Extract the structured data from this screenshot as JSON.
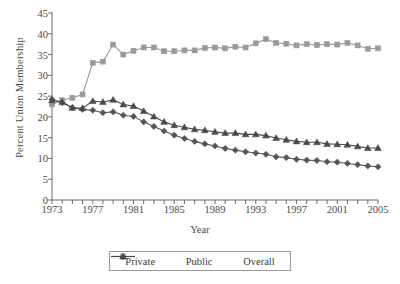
{
  "chart_data": {
    "type": "line",
    "title": "",
    "xlabel": "Year",
    "ylabel": "Percent Union Membership",
    "xlim": [
      1973,
      2005
    ],
    "ylim": [
      0,
      45
    ],
    "ytick_labels": [
      "0",
      "5",
      "10",
      "15",
      "20",
      "25",
      "30",
      "35",
      "40",
      "45"
    ],
    "ytick_values": [
      0,
      5,
      10,
      15,
      20,
      25,
      30,
      35,
      40,
      45
    ],
    "xtick_labels": [
      "1973",
      "1977",
      "1981",
      "1985",
      "1989",
      "1993",
      "1997",
      "2001",
      "2005"
    ],
    "xtick_values": [
      1973,
      1977,
      1981,
      1985,
      1989,
      1993,
      1997,
      2001,
      2005
    ],
    "xtick_minor_every": 1,
    "grid": false,
    "legend_position": "bottom-center",
    "x": [
      1973,
      1974,
      1975,
      1976,
      1977,
      1978,
      1979,
      1980,
      1981,
      1982,
      1983,
      1984,
      1985,
      1986,
      1987,
      1988,
      1989,
      1990,
      1991,
      1992,
      1993,
      1994,
      1995,
      1996,
      1997,
      1998,
      1999,
      2000,
      2001,
      2002,
      2003,
      2004,
      2005
    ],
    "series": [
      {
        "name": "Private",
        "marker": "diamond",
        "color": "#555555",
        "values": [
          24.2,
          23.4,
          22.2,
          21.8,
          21.6,
          21.0,
          21.2,
          20.4,
          20.1,
          18.8,
          17.7,
          16.6,
          15.6,
          14.8,
          14.1,
          13.5,
          13.0,
          12.4,
          12.0,
          11.6,
          11.3,
          11.0,
          10.4,
          10.2,
          9.8,
          9.6,
          9.5,
          9.2,
          9.1,
          8.8,
          8.5,
          8.2,
          8.0
        ],
        "final_value": 8.0
      },
      {
        "name": "Public",
        "marker": "square",
        "color": "#9a9a9a",
        "values": [
          23.0,
          24.0,
          24.6,
          25.4,
          33.0,
          33.3,
          37.4,
          35.0,
          35.9,
          36.7,
          36.7,
          35.8,
          35.8,
          36.0,
          36.0,
          36.6,
          36.7,
          36.5,
          36.9,
          36.7,
          37.7,
          38.7,
          37.8,
          37.6,
          37.2,
          37.5,
          37.3,
          37.5,
          37.4,
          37.8,
          37.2,
          36.4,
          36.5
        ],
        "final_value": 36.5
      },
      {
        "name": "Overall",
        "marker": "triangle",
        "color": "#4a4a4a",
        "values": [
          24.0,
          23.6,
          22.2,
          22.1,
          23.8,
          23.6,
          24.1,
          23.0,
          22.6,
          21.4,
          20.1,
          18.8,
          18.0,
          17.5,
          17.0,
          16.8,
          16.4,
          16.1,
          16.1,
          15.8,
          15.8,
          15.5,
          14.9,
          14.5,
          14.1,
          13.9,
          13.9,
          13.5,
          13.4,
          13.3,
          12.9,
          12.5,
          12.5
        ],
        "final_value": 12.5
      }
    ]
  }
}
